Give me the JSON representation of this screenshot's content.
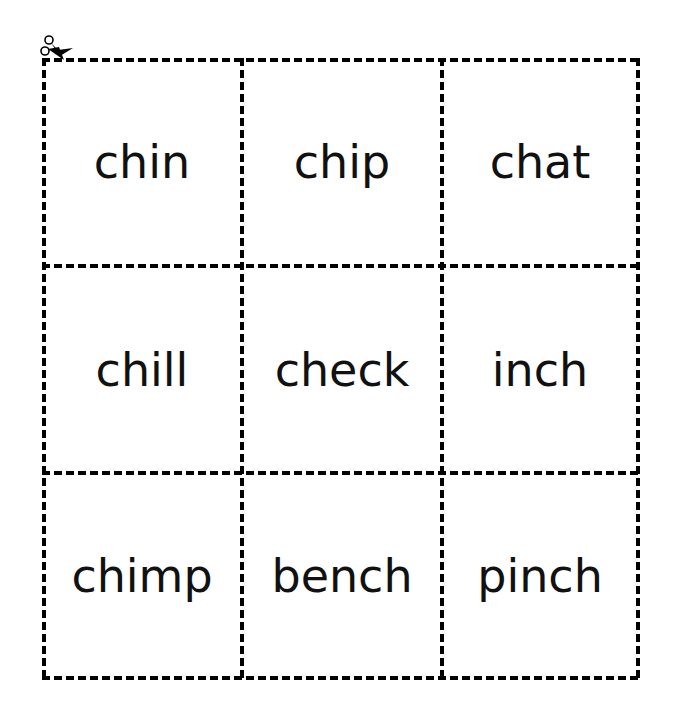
{
  "worksheet": {
    "cut_icon": "scissors-icon",
    "cards": [
      [
        "chin",
        "chip",
        "chat"
      ],
      [
        "chill",
        "check",
        "inch"
      ],
      [
        "chimp",
        "bench",
        "pinch"
      ]
    ]
  }
}
